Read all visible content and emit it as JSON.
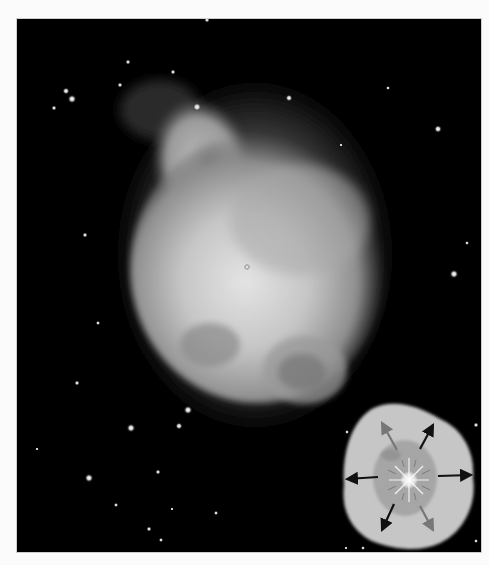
{
  "image": {
    "subject": "planetary nebula photograph",
    "background_color": "#000000",
    "page_color": "#fbfbfb",
    "frame": {
      "x": 17,
      "y": 19,
      "width": 464,
      "height": 533
    }
  },
  "stars": [
    {
      "x": 66,
      "y": 91,
      "r": 2.0
    },
    {
      "x": 72,
      "y": 99,
      "r": 2.5
    },
    {
      "x": 54,
      "y": 108,
      "r": 1.5
    },
    {
      "x": 128,
      "y": 62,
      "r": 1.5
    },
    {
      "x": 173,
      "y": 72,
      "r": 1.5
    },
    {
      "x": 120,
      "y": 85,
      "r": 1.5
    },
    {
      "x": 197,
      "y": 107,
      "r": 2.5
    },
    {
      "x": 207,
      "y": 20,
      "r": 1.5
    },
    {
      "x": 289,
      "y": 98,
      "r": 2.0
    },
    {
      "x": 388,
      "y": 88,
      "r": 1.2
    },
    {
      "x": 438,
      "y": 129,
      "r": 2.2
    },
    {
      "x": 341,
      "y": 145,
      "r": 1.0
    },
    {
      "x": 467,
      "y": 243,
      "r": 1.2
    },
    {
      "x": 454,
      "y": 274,
      "r": 2.5
    },
    {
      "x": 85,
      "y": 235,
      "r": 1.5
    },
    {
      "x": 98,
      "y": 323,
      "r": 1.3
    },
    {
      "x": 77,
      "y": 383,
      "r": 1.5
    },
    {
      "x": 188,
      "y": 410,
      "r": 2.5
    },
    {
      "x": 179,
      "y": 426,
      "r": 2.0
    },
    {
      "x": 131,
      "y": 428,
      "r": 2.5
    },
    {
      "x": 89,
      "y": 478,
      "r": 2.5
    },
    {
      "x": 158,
      "y": 472,
      "r": 1.5
    },
    {
      "x": 116,
      "y": 505,
      "r": 1.3
    },
    {
      "x": 172,
      "y": 509,
      "r": 1.0
    },
    {
      "x": 216,
      "y": 513,
      "r": 1.3
    },
    {
      "x": 149,
      "y": 529,
      "r": 1.5
    },
    {
      "x": 161,
      "y": 540,
      "r": 1.3
    },
    {
      "x": 37,
      "y": 449,
      "r": 1.0
    },
    {
      "x": 346,
      "y": 548,
      "r": 1.0
    },
    {
      "x": 363,
      "y": 548,
      "r": 1.2
    },
    {
      "x": 476,
      "y": 541,
      "r": 1.2
    },
    {
      "x": 476,
      "y": 425,
      "r": 1.5
    },
    {
      "x": 347,
      "y": 432,
      "r": 1.2
    }
  ],
  "nebula": {
    "center": {
      "x": 258,
      "y": 265
    },
    "central_star": {
      "x": 247,
      "y": 267
    },
    "color_core": "#d8d8d8",
    "color_shell": "#9a9a9a",
    "color_halo": "#3a3a3a"
  },
  "inset_diagram": {
    "description": "expanding gas shell schematic",
    "outer_shell_color": "#c8c8c8",
    "inner_shell_color": "#a6a6a6",
    "star_color": "#ffffff",
    "center": {
      "x": 409,
      "y": 480
    },
    "arrows": [
      {
        "direction": "left",
        "from": [
          378,
          477
        ],
        "to": [
          347,
          479
        ],
        "color": "#111111"
      },
      {
        "direction": "right",
        "from": [
          438,
          476
        ],
        "to": [
          471,
          475
        ],
        "color": "#111111"
      },
      {
        "direction": "up-left",
        "from": [
          397,
          450
        ],
        "to": [
          382,
          423
        ],
        "color": "#777777"
      },
      {
        "direction": "up-right",
        "from": [
          420,
          449
        ],
        "to": [
          433,
          425
        ],
        "color": "#111111"
      },
      {
        "direction": "down-left",
        "from": [
          394,
          504
        ],
        "to": [
          382,
          530
        ],
        "color": "#111111"
      },
      {
        "direction": "down-right",
        "from": [
          420,
          506
        ],
        "to": [
          433,
          530
        ],
        "color": "#777777"
      }
    ]
  }
}
